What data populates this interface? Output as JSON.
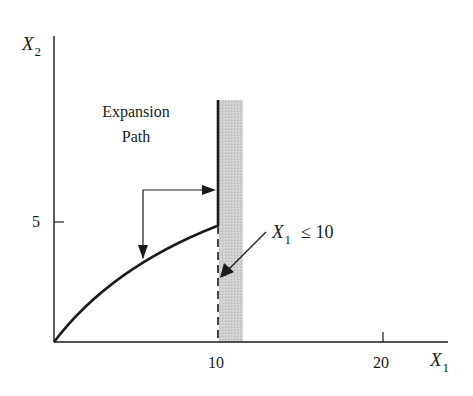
{
  "diagram": {
    "type": "constrained expansion path",
    "y_axis": {
      "label_var": "X",
      "label_sub": "2",
      "ticks": [
        {
          "value": "5",
          "y": 5
        }
      ]
    },
    "x_axis": {
      "label_var": "X",
      "label_sub": "1",
      "ticks": [
        {
          "value": "10",
          "x": 10
        },
        {
          "value": "20",
          "x": 20
        }
      ]
    },
    "annotations": {
      "expansion_path_line1": "Expansion",
      "expansion_path_line2": "Path",
      "constraint_var": "X",
      "constraint_sub": "1",
      "constraint_text": "≤  10"
    },
    "constraint": {
      "x1_max": 10,
      "shaded_region": "X1 > 10 (infeasible)"
    },
    "colors": {
      "ink": "#1a1a1a",
      "shade": "#c8c8c8",
      "background": "#ffffff"
    }
  }
}
